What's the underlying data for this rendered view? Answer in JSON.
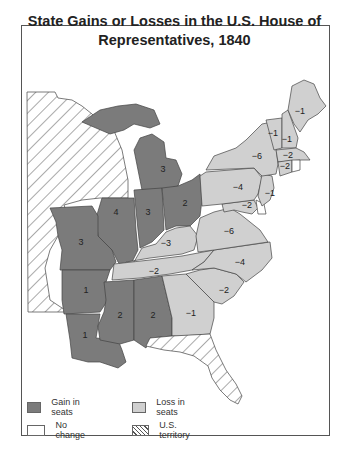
{
  "title_line1": "State Gains or Losses in the U.S. House of",
  "title_line2": "Representatives, 1840",
  "colors": {
    "gain": "#7b7b7b",
    "loss": "#d0d0d0",
    "no_change": "#ffffff",
    "territory_hatch": "#555555",
    "border": "#444444"
  },
  "states": [
    {
      "name": "Maine",
      "change": "-1",
      "category": "loss"
    },
    {
      "name": "Vermont",
      "change": "-1",
      "category": "loss"
    },
    {
      "name": "New Hampshire",
      "change": "-1",
      "category": "loss"
    },
    {
      "name": "Massachusetts",
      "change": "-2",
      "category": "loss"
    },
    {
      "name": "Connecticut",
      "change": "-2",
      "category": "loss"
    },
    {
      "name": "Rhode Island",
      "change": "",
      "category": "no_change"
    },
    {
      "name": "New York",
      "change": "-6",
      "category": "loss"
    },
    {
      "name": "New Jersey",
      "change": "-1",
      "category": "loss"
    },
    {
      "name": "Pennsylvania",
      "change": "-4",
      "category": "loss"
    },
    {
      "name": "Maryland",
      "change": "-2",
      "category": "loss"
    },
    {
      "name": "Delaware",
      "change": "",
      "category": "no_change"
    },
    {
      "name": "Virginia",
      "change": "-6",
      "category": "loss"
    },
    {
      "name": "North Carolina",
      "change": "-4",
      "category": "loss"
    },
    {
      "name": "South Carolina",
      "change": "-2",
      "category": "loss"
    },
    {
      "name": "Georgia",
      "change": "-1",
      "category": "loss"
    },
    {
      "name": "Ohio",
      "change": "2",
      "category": "gain"
    },
    {
      "name": "Michigan",
      "change": "3",
      "category": "gain"
    },
    {
      "name": "Indiana",
      "change": "3",
      "category": "gain"
    },
    {
      "name": "Illinois",
      "change": "4",
      "category": "gain"
    },
    {
      "name": "Kentucky",
      "change": "-3",
      "category": "loss"
    },
    {
      "name": "Tennessee",
      "change": "-2",
      "category": "loss"
    },
    {
      "name": "Missouri",
      "change": "3",
      "category": "gain"
    },
    {
      "name": "Arkansas",
      "change": "1",
      "category": "gain"
    },
    {
      "name": "Louisiana",
      "change": "1",
      "category": "gain"
    },
    {
      "name": "Mississippi",
      "change": "2",
      "category": "gain"
    },
    {
      "name": "Alabama",
      "change": "2",
      "category": "gain"
    },
    {
      "name": "Iowa/Wisconsin Territory",
      "change": "",
      "category": "territory"
    },
    {
      "name": "Florida Territory",
      "change": "",
      "category": "territory"
    }
  ],
  "legend": {
    "gain": "Gain in seats",
    "loss": "Loss in seats",
    "no_change": "No change",
    "territory": "U.S. territory"
  }
}
